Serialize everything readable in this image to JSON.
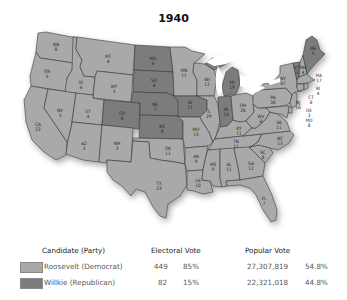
{
  "title": "1940",
  "colors": {
    "democrat": "#a9a9a9",
    "republican": "#7c7c7c",
    "border": "#3a3a3a",
    "lakes": "#ffffff"
  },
  "legend": {
    "headers": {
      "candidate": "Candidate (Party)",
      "electoral": "Electoral Vote",
      "popular": "Popular Vote"
    },
    "rows": [
      {
        "candidate": "Roosevelt (Democrat)",
        "party": "democrat",
        "electoral_votes": "449",
        "electoral_pct": "85%",
        "popular_votes": "27,307,819",
        "popular_pct": "54.8%"
      },
      {
        "candidate": "Willkie (Republican)",
        "party": "republican",
        "electoral_votes": "82",
        "electoral_pct": "15%",
        "popular_votes": "22,321,018",
        "popular_pct": "44.8%"
      }
    ]
  },
  "states": {
    "WA": {
      "abbr": "WA",
      "ev": "8",
      "winner": "democrat"
    },
    "OR": {
      "abbr": "OR",
      "ev": "5",
      "winner": "democrat"
    },
    "CA": {
      "abbr": "CA",
      "ev": "22",
      "winner": "democrat"
    },
    "ID": {
      "abbr": "ID",
      "ev": "4",
      "winner": "democrat"
    },
    "NV": {
      "abbr": "NV",
      "ev": "3",
      "winner": "democrat"
    },
    "MT": {
      "abbr": "MT",
      "ev": "4",
      "winner": "democrat"
    },
    "WY": {
      "abbr": "WY",
      "ev": "3",
      "winner": "democrat"
    },
    "UT": {
      "abbr": "UT",
      "ev": "4",
      "winner": "democrat"
    },
    "AZ": {
      "abbr": "AZ",
      "ev": "3",
      "winner": "democrat"
    },
    "CO": {
      "abbr": "CO",
      "ev": "6",
      "winner": "republican"
    },
    "NM": {
      "abbr": "NM",
      "ev": "3",
      "winner": "democrat"
    },
    "ND": {
      "abbr": "ND",
      "ev": "4",
      "winner": "republican"
    },
    "SD": {
      "abbr": "SD",
      "ev": "4",
      "winner": "republican"
    },
    "NE": {
      "abbr": "NE",
      "ev": "7",
      "winner": "republican"
    },
    "KS": {
      "abbr": "KS",
      "ev": "9",
      "winner": "republican"
    },
    "OK": {
      "abbr": "OK",
      "ev": "11",
      "winner": "democrat"
    },
    "TX": {
      "abbr": "TX",
      "ev": "23",
      "winner": "democrat"
    },
    "MN": {
      "abbr": "MN",
      "ev": "11",
      "winner": "democrat"
    },
    "IA": {
      "abbr": "IA",
      "ev": "11",
      "winner": "republican"
    },
    "MO": {
      "abbr": "MO",
      "ev": "15",
      "winner": "democrat"
    },
    "AR": {
      "abbr": "AR",
      "ev": "9",
      "winner": "democrat"
    },
    "LA": {
      "abbr": "LA",
      "ev": "10",
      "winner": "democrat"
    },
    "WI": {
      "abbr": "WI",
      "ev": "12",
      "winner": "democrat"
    },
    "IL": {
      "abbr": "IL",
      "ev": "29",
      "winner": "democrat"
    },
    "MI": {
      "abbr": "MI",
      "ev": "19",
      "winner": "republican"
    },
    "IN": {
      "abbr": "IN",
      "ev": "14",
      "winner": "republican"
    },
    "OH": {
      "abbr": "OH",
      "ev": "26",
      "winner": "democrat"
    },
    "KY": {
      "abbr": "KY",
      "ev": "11",
      "winner": "democrat"
    },
    "TN": {
      "abbr": "TN",
      "ev": "11",
      "winner": "democrat"
    },
    "MS": {
      "abbr": "MS",
      "ev": "9",
      "winner": "democrat"
    },
    "AL": {
      "abbr": "AL",
      "ev": "11",
      "winner": "democrat"
    },
    "GA": {
      "abbr": "GA",
      "ev": "12",
      "winner": "democrat"
    },
    "FL": {
      "abbr": "FL",
      "ev": "7",
      "winner": "democrat"
    },
    "SC": {
      "abbr": "SC",
      "ev": "8",
      "winner": "democrat"
    },
    "NC": {
      "abbr": "NC",
      "ev": "13",
      "winner": "democrat"
    },
    "VA": {
      "abbr": "VA",
      "ev": "11",
      "winner": "democrat"
    },
    "WV": {
      "abbr": "WV",
      "ev": "8",
      "winner": "democrat"
    },
    "PA": {
      "abbr": "PA",
      "ev": "36",
      "winner": "democrat"
    },
    "NY": {
      "abbr": "NY",
      "ev": "47",
      "winner": "democrat"
    },
    "VT": {
      "abbr": "VT",
      "ev": "3",
      "winner": "republican"
    },
    "NH": {
      "abbr": "NH",
      "ev": "4",
      "winner": "democrat"
    },
    "ME": {
      "abbr": "ME",
      "ev": "5",
      "winner": "republican"
    },
    "MA": {
      "abbr": "MA",
      "ev": "17",
      "winner": "democrat"
    },
    "RI": {
      "abbr": "RI",
      "ev": "4",
      "winner": "democrat"
    },
    "CT": {
      "abbr": "CT",
      "ev": "8",
      "winner": "democrat"
    },
    "NJ": {
      "abbr": "NJ",
      "ev": "16",
      "winner": "democrat"
    },
    "DE": {
      "abbr": "DE",
      "ev": "3",
      "winner": "democrat"
    },
    "MD": {
      "abbr": "MD",
      "ev": "8",
      "winner": "democrat"
    }
  }
}
